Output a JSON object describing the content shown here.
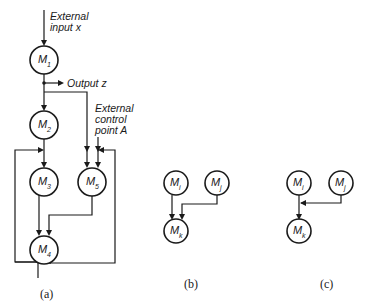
{
  "panel_a": {
    "caption": "(a)",
    "input_label_line1": "External",
    "input_label_line2": "input x",
    "output_label": "Output z",
    "control_label_line1": "External",
    "control_label_line2": "control",
    "control_label_line3": "point A",
    "nodes": [
      {
        "letter": "M",
        "sub": "1"
      },
      {
        "letter": "M",
        "sub": "2"
      },
      {
        "letter": "M",
        "sub": "3"
      },
      {
        "letter": "M",
        "sub": "5"
      },
      {
        "letter": "M",
        "sub": "4"
      }
    ]
  },
  "panel_b": {
    "caption": "(b)",
    "nodes": [
      {
        "letter": "M",
        "sub": "i"
      },
      {
        "letter": "M",
        "sub": "j"
      },
      {
        "letter": "M",
        "sub": "k"
      }
    ]
  },
  "panel_c": {
    "caption": "(c)",
    "nodes": [
      {
        "letter": "M",
        "sub": "i"
      },
      {
        "letter": "M",
        "sub": "j"
      },
      {
        "letter": "M",
        "sub": "k"
      }
    ]
  }
}
